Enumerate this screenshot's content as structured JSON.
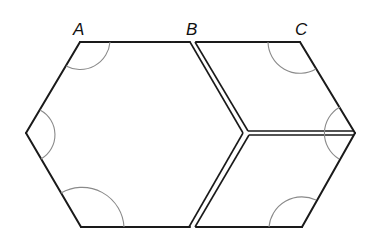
{
  "diagram": {
    "title": "",
    "labels": {
      "A": "A",
      "B": "B",
      "C": "C"
    },
    "colors": {
      "edge": "#1a1a1a",
      "arc": "#8a8a8a",
      "background": "#ffffff"
    },
    "shapes": [
      {
        "name": "large-hexagon-half",
        "description": "Half hexagon (trapezoid-like) on left"
      },
      {
        "name": "upper-rhombus",
        "description": "Rhombus at upper right between B, C"
      },
      {
        "name": "lower-rhombus",
        "description": "Rhombus at lower right"
      }
    ]
  }
}
